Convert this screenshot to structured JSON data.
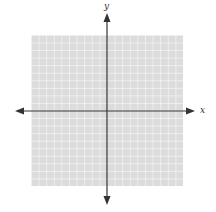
{
  "diagram": {
    "type": "coordinate-plane",
    "axes": {
      "x_label": "x",
      "y_label": "y"
    },
    "grid": {
      "cells_x": 20,
      "cells_y": 20,
      "fill_color": "#dcdcdc",
      "line_color": "#ffffff"
    },
    "axis_color": "#333333"
  }
}
